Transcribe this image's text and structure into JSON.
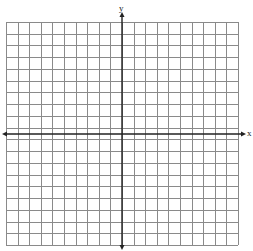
{
  "diagram": {
    "type": "coordinate-plane",
    "x_axis_label": "x",
    "y_axis_label": "y",
    "grid": {
      "columns": 20,
      "rows": 19,
      "left": 6,
      "top": 22,
      "right": 238,
      "bottom": 245,
      "line_color": "#8a8a8a",
      "axis_color": "#222222"
    },
    "axes": {
      "y_axis_x": 122,
      "x_axis_y": 134,
      "x_arrow_left": 2,
      "x_arrow_right": 246,
      "y_arrow_top": 12,
      "y_arrow_bottom": 250
    }
  }
}
